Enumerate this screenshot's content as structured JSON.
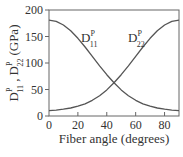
{
  "chart_data": {
    "type": "line",
    "title": "",
    "xlabel": "Fiber angle (degrees)",
    "ylabel": "D11^P , D22^P (GPa)",
    "ylabel_parts": {
      "d": "D",
      "p": "P",
      "sub1": "11",
      "sub2": "22",
      "sep": " ,",
      "unit": "(GPa)"
    },
    "xlim": [
      0,
      90
    ],
    "ylim": [
      0,
      200
    ],
    "x_ticks": [
      0,
      20,
      40,
      60,
      80
    ],
    "y_ticks": [
      0,
      50,
      100,
      150,
      200
    ],
    "grid": false,
    "legend": "inline labels",
    "x": [
      0,
      5,
      10,
      15,
      20,
      25,
      30,
      35,
      40,
      45,
      50,
      55,
      60,
      65,
      70,
      75,
      80,
      85,
      90
    ],
    "series": [
      {
        "name": "D11^P",
        "label_main": "D",
        "label_sup": "P",
        "label_sub": "11",
        "values": [
          181,
          178.6,
          171.7,
          160.7,
          146.6,
          130.2,
          112.6,
          94.8,
          77.9,
          62.6,
          49.3,
          38.3,
          29.6,
          23.1,
          18.4,
          15.1,
          12.8,
          11.2,
          10
        ]
      },
      {
        "name": "D22^P",
        "label_main": "D",
        "label_sup": "P",
        "label_sub": "22",
        "values": [
          10,
          11.2,
          12.8,
          15.1,
          18.4,
          23.1,
          29.6,
          38.3,
          49.3,
          62.6,
          77.9,
          94.8,
          112.6,
          130.2,
          146.6,
          160.7,
          171.7,
          178.6,
          181
        ]
      }
    ],
    "colors": {
      "line": "#555555",
      "axis": "#666666",
      "text": "#333333"
    }
  }
}
